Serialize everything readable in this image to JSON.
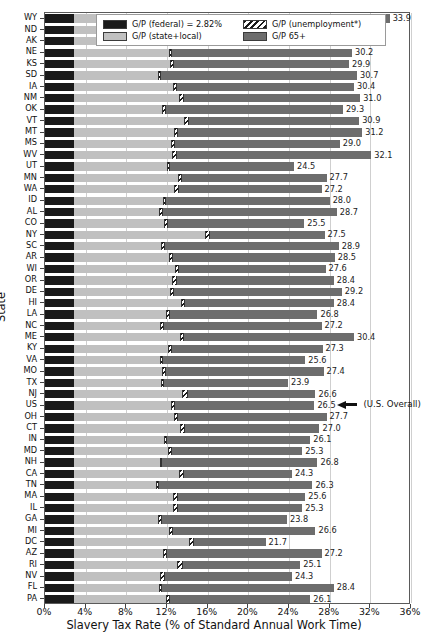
{
  "chart_data": {
    "type": "bar",
    "orientation": "horizontal",
    "stacked": true,
    "title": "",
    "xlabel": "Slavery Tax Rate (% of Standard Annual Work Time)",
    "ylabel": "State",
    "xlim": [
      0,
      36
    ],
    "xticks": [
      "0%",
      "4%",
      "8%",
      "12%",
      "16%",
      "20%",
      "24%",
      "28%",
      "32%",
      "36%"
    ],
    "xtick_values": [
      0,
      4,
      8,
      12,
      16,
      20,
      24,
      28,
      32,
      36
    ],
    "grid": "vertical",
    "legend_position": "upper center",
    "legend": [
      {
        "label": "G/P (federal) = 2.82%",
        "key": "federal",
        "color": "#1a1a1a"
      },
      {
        "label": "G/P (unemployment*)",
        "key": "unemployment",
        "color": "hatched"
      },
      {
        "label": "G/P (state+local)",
        "key": "state_local",
        "color": "#c0c0c0"
      },
      {
        "label": "G/P 65+",
        "key": "g65",
        "color": "#6d6d6d"
      }
    ],
    "series": [
      {
        "name": "G/P (federal)",
        "key": "federal"
      },
      {
        "name": "G/P (state+local)",
        "key": "state_local"
      },
      {
        "name": "G/P (unemployment*)",
        "key": "unemployment"
      },
      {
        "name": "G/P 65+",
        "key": "g65"
      }
    ],
    "federal_constant": 2.82,
    "annotation": {
      "text": "(U.S. Overall)",
      "target_category": "US"
    },
    "categories": [
      "WY",
      "ND",
      "AK",
      "NE",
      "KS",
      "SD",
      "IA",
      "NM",
      "OK",
      "VT",
      "MT",
      "MS",
      "WV",
      "UT",
      "MN",
      "WA",
      "ID",
      "AL",
      "CO",
      "NY",
      "SC",
      "AR",
      "WI",
      "OR",
      "DE",
      "HI",
      "LA",
      "NC",
      "ME",
      "KY",
      "VA",
      "MO",
      "TX",
      "NJ",
      "US",
      "OH",
      "CT",
      "IN",
      "MD",
      "NH",
      "CA",
      "TN",
      "MA",
      "IL",
      "GA",
      "MI",
      "DC",
      "AZ",
      "RI",
      "NV",
      "FL",
      "PA"
    ],
    "totals": [
      33.9,
      31.2,
      27.1,
      30.2,
      29.9,
      30.7,
      30.4,
      31.0,
      29.3,
      30.9,
      31.2,
      29.0,
      32.1,
      24.5,
      27.7,
      27.2,
      28.0,
      28.7,
      25.5,
      27.5,
      28.9,
      28.5,
      27.6,
      28.4,
      29.2,
      28.4,
      26.8,
      27.2,
      30.4,
      27.3,
      25.6,
      27.4,
      23.9,
      26.6,
      26.5,
      27.7,
      27.0,
      26.1,
      25.3,
      26.8,
      24.3,
      26.3,
      25.6,
      25.3,
      23.8,
      26.6,
      21.7,
      27.2,
      25.1,
      24.3,
      28.4,
      26.1
    ],
    "rows": [
      {
        "state": "WY",
        "federal": 2.82,
        "state_local": 15.3,
        "unemployment": 0.5,
        "g65": 15.28,
        "total": 33.9
      },
      {
        "state": "ND",
        "federal": 2.82,
        "state_local": 8.9,
        "unemployment": 0.4,
        "g65": 19.08,
        "total": 31.2
      },
      {
        "state": "AK",
        "federal": 2.82,
        "state_local": 9.1,
        "unemployment": 0.6,
        "g65": 14.58,
        "total": 27.1
      },
      {
        "state": "NE",
        "federal": 2.82,
        "state_local": 9.4,
        "unemployment": 0.3,
        "g65": 17.68,
        "total": 30.2
      },
      {
        "state": "KS",
        "federal": 2.82,
        "state_local": 9.5,
        "unemployment": 0.4,
        "g65": 17.18,
        "total": 29.9
      },
      {
        "state": "SD",
        "federal": 2.82,
        "state_local": 8.3,
        "unemployment": 0.3,
        "g65": 19.28,
        "total": 30.7
      },
      {
        "state": "IA",
        "federal": 2.82,
        "state_local": 9.8,
        "unemployment": 0.4,
        "g65": 17.38,
        "total": 30.4
      },
      {
        "state": "NM",
        "federal": 2.82,
        "state_local": 10.4,
        "unemployment": 0.5,
        "g65": 17.28,
        "total": 31.0
      },
      {
        "state": "OK",
        "federal": 2.82,
        "state_local": 8.7,
        "unemployment": 0.4,
        "g65": 17.38,
        "total": 29.3
      },
      {
        "state": "VT",
        "federal": 2.82,
        "state_local": 10.9,
        "unemployment": 0.4,
        "g65": 16.78,
        "total": 30.9
      },
      {
        "state": "MT",
        "federal": 2.82,
        "state_local": 9.9,
        "unemployment": 0.4,
        "g65": 18.08,
        "total": 31.2
      },
      {
        "state": "MS",
        "federal": 2.82,
        "state_local": 9.6,
        "unemployment": 0.4,
        "g65": 16.18,
        "total": 29.0
      },
      {
        "state": "WV",
        "federal": 2.82,
        "state_local": 9.7,
        "unemployment": 0.5,
        "g65": 19.08,
        "total": 32.1
      },
      {
        "state": "UT",
        "federal": 2.82,
        "state_local": 9.2,
        "unemployment": 0.3,
        "g65": 12.18,
        "total": 24.5
      },
      {
        "state": "MN",
        "federal": 2.82,
        "state_local": 10.3,
        "unemployment": 0.4,
        "g65": 14.18,
        "total": 27.7
      },
      {
        "state": "WA",
        "federal": 2.82,
        "state_local": 9.9,
        "unemployment": 0.5,
        "g65": 13.98,
        "total": 27.2
      },
      {
        "state": "ID",
        "federal": 2.82,
        "state_local": 8.8,
        "unemployment": 0.3,
        "g65": 16.08,
        "total": 28.0
      },
      {
        "state": "AL",
        "federal": 2.82,
        "state_local": 8.4,
        "unemployment": 0.4,
        "g65": 17.08,
        "total": 28.7
      },
      {
        "state": "CO",
        "federal": 2.82,
        "state_local": 8.9,
        "unemployment": 0.4,
        "g65": 13.38,
        "total": 25.5
      },
      {
        "state": "NY",
        "federal": 2.82,
        "state_local": 12.9,
        "unemployment": 0.5,
        "g65": 11.28,
        "total": 27.5
      },
      {
        "state": "SC",
        "federal": 2.82,
        "state_local": 8.6,
        "unemployment": 0.4,
        "g65": 17.08,
        "total": 28.9
      },
      {
        "state": "AR",
        "federal": 2.82,
        "state_local": 9.4,
        "unemployment": 0.4,
        "g65": 15.88,
        "total": 28.5
      },
      {
        "state": "WI",
        "federal": 2.82,
        "state_local": 10.0,
        "unemployment": 0.4,
        "g65": 14.38,
        "total": 27.6
      },
      {
        "state": "OR",
        "federal": 2.82,
        "state_local": 9.7,
        "unemployment": 0.5,
        "g65": 15.38,
        "total": 28.4
      },
      {
        "state": "DE",
        "federal": 2.82,
        "state_local": 9.5,
        "unemployment": 0.4,
        "g65": 16.48,
        "total": 29.2
      },
      {
        "state": "HI",
        "federal": 2.82,
        "state_local": 10.6,
        "unemployment": 0.4,
        "g65": 14.58,
        "total": 28.4
      },
      {
        "state": "LA",
        "federal": 2.82,
        "state_local": 9.1,
        "unemployment": 0.4,
        "g65": 14.48,
        "total": 26.8
      },
      {
        "state": "NC",
        "federal": 2.82,
        "state_local": 8.5,
        "unemployment": 0.4,
        "g65": 15.48,
        "total": 27.2
      },
      {
        "state": "ME",
        "federal": 2.82,
        "state_local": 10.5,
        "unemployment": 0.4,
        "g65": 16.68,
        "total": 30.4
      },
      {
        "state": "KY",
        "federal": 2.82,
        "state_local": 9.3,
        "unemployment": 0.4,
        "g65": 14.78,
        "total": 27.3
      },
      {
        "state": "VA",
        "federal": 2.82,
        "state_local": 8.5,
        "unemployment": 0.3,
        "g65": 13.98,
        "total": 25.6
      },
      {
        "state": "MO",
        "federal": 2.82,
        "state_local": 8.7,
        "unemployment": 0.4,
        "g65": 15.48,
        "total": 27.4
      },
      {
        "state": "TX",
        "federal": 2.82,
        "state_local": 8.6,
        "unemployment": 0.3,
        "g65": 12.18,
        "total": 23.9
      },
      {
        "state": "NJ",
        "federal": 2.82,
        "state_local": 10.7,
        "unemployment": 0.5,
        "g65": 12.58,
        "total": 26.6
      },
      {
        "state": "US",
        "federal": 2.82,
        "state_local": 9.6,
        "unemployment": 0.4,
        "g65": 13.68,
        "total": 26.5
      },
      {
        "state": "OH",
        "federal": 2.82,
        "state_local": 9.9,
        "unemployment": 0.4,
        "g65": 14.58,
        "total": 27.7
      },
      {
        "state": "CT",
        "federal": 2.82,
        "state_local": 10.5,
        "unemployment": 0.5,
        "g65": 13.18,
        "total": 27.0
      },
      {
        "state": "IN",
        "federal": 2.82,
        "state_local": 8.9,
        "unemployment": 0.3,
        "g65": 14.08,
        "total": 26.1
      },
      {
        "state": "MD",
        "federal": 2.82,
        "state_local": 9.3,
        "unemployment": 0.4,
        "g65": 12.78,
        "total": 25.3
      },
      {
        "state": "NH",
        "federal": 2.82,
        "state_local": 8.5,
        "unemployment": 0.2,
        "g65": 15.28,
        "total": 26.8
      },
      {
        "state": "CA",
        "federal": 2.82,
        "state_local": 10.4,
        "unemployment": 0.5,
        "g65": 10.58,
        "total": 24.3
      },
      {
        "state": "TN",
        "federal": 2.82,
        "state_local": 8.1,
        "unemployment": 0.3,
        "g65": 15.08,
        "total": 26.3
      },
      {
        "state": "MA",
        "federal": 2.82,
        "state_local": 9.8,
        "unemployment": 0.5,
        "g65": 12.48,
        "total": 25.6
      },
      {
        "state": "IL",
        "federal": 2.82,
        "state_local": 9.8,
        "unemployment": 0.5,
        "g65": 12.18,
        "total": 25.3
      },
      {
        "state": "GA",
        "federal": 2.82,
        "state_local": 8.3,
        "unemployment": 0.4,
        "g65": 12.28,
        "total": 23.8
      },
      {
        "state": "MI",
        "federal": 2.82,
        "state_local": 9.4,
        "unemployment": 0.4,
        "g65": 13.98,
        "total": 26.6
      },
      {
        "state": "DC",
        "federal": 2.82,
        "state_local": 11.3,
        "unemployment": 0.5,
        "g65": 7.08,
        "total": 21.7
      },
      {
        "state": "AZ",
        "federal": 2.82,
        "state_local": 8.8,
        "unemployment": 0.4,
        "g65": 15.18,
        "total": 27.2
      },
      {
        "state": "RI",
        "federal": 2.82,
        "state_local": 10.2,
        "unemployment": 0.6,
        "g65": 11.48,
        "total": 25.1
      },
      {
        "state": "NV",
        "federal": 2.82,
        "state_local": 8.5,
        "unemployment": 0.5,
        "g65": 12.48,
        "total": 24.3
      },
      {
        "state": "FL",
        "federal": 2.82,
        "state_local": 8.4,
        "unemployment": 0.3,
        "g65": 16.88,
        "total": 28.4
      },
      {
        "state": "PA",
        "federal": 2.82,
        "state_local": 9.1,
        "unemployment": 0.4,
        "g65": 13.78,
        "total": 26.1
      }
    ]
  }
}
